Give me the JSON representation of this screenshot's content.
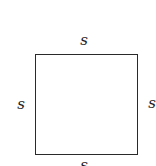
{
  "diagram": {
    "shape": "square",
    "stroke_color": "#2a2a2a",
    "labels": {
      "top": "s",
      "left": "s",
      "right": "s",
      "bottom": "s"
    }
  }
}
